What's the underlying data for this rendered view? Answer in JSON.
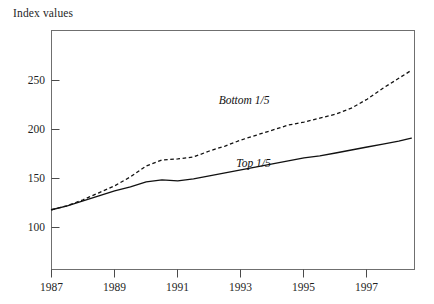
{
  "chart_data": {
    "type": "line",
    "title": "",
    "subtitle": "",
    "ylabel": "Index values",
    "xlabel": "",
    "ylim": [
      40,
      280
    ],
    "xlim": [
      1987,
      1998.5
    ],
    "yticks": [
      100,
      150,
      200,
      250
    ],
    "ytick_labels": [
      "100",
      "150",
      "200",
      "250"
    ],
    "xticks": [
      1987,
      1989,
      1991,
      1993,
      1995,
      1997
    ],
    "xtick_labels": [
      "1987",
      "1989",
      "1991",
      "1993",
      "1995",
      "1997"
    ],
    "grid": false,
    "legend_position": "inline-annotations",
    "x": [
      1987,
      1987.5,
      1988,
      1988.5,
      1989,
      1989.5,
      1990,
      1990.5,
      1991,
      1991.5,
      1992,
      1992.5,
      1993,
      1993.5,
      1994,
      1994.5,
      1995,
      1995.5,
      1996,
      1996.5,
      1997,
      1997.5,
      1998,
      1998.4
    ],
    "series": [
      {
        "name": "Bottom 1/5",
        "label": "Bottom 1/5",
        "style": "dashed",
        "values": [
          100,
          104,
          110,
          117,
          124,
          133,
          144,
          150,
          151,
          153,
          159,
          164,
          170,
          175,
          180,
          185,
          188,
          192,
          196,
          202,
          211,
          222,
          232,
          240
        ]
      },
      {
        "name": "Top 1/5",
        "label": "Top 1/5",
        "style": "solid",
        "values": [
          100,
          104,
          109,
          114,
          119,
          123,
          128,
          130,
          129,
          131,
          134,
          137,
          140,
          143,
          146,
          149,
          152,
          154,
          157,
          160,
          163,
          166,
          169,
          172
        ]
      }
    ],
    "annotations": [
      {
        "text": "Bottom 1/5",
        "x": 1993.1,
        "y": 206
      },
      {
        "text": "Top 1/5",
        "x": 1993.4,
        "y": 143
      }
    ],
    "colors": {
      "line": "#111111",
      "axis": "#6f6f6f",
      "text": "#1f1f1f",
      "background": "#ffffff"
    }
  }
}
